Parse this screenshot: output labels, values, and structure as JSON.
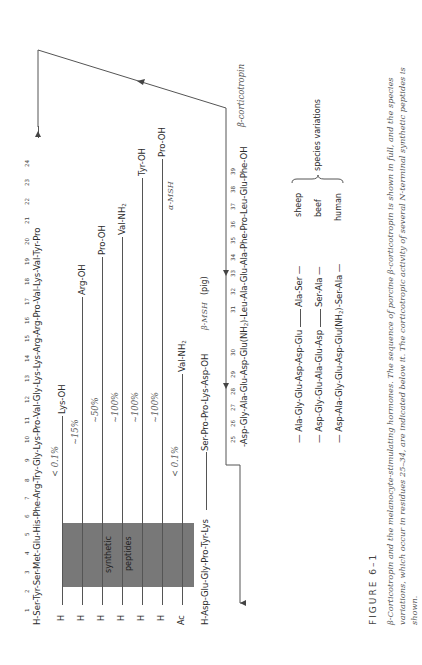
{
  "figure": {
    "label": "FIGURE 6–1",
    "caption_line1": "β-Corticotropin and the melanocyte-stimulating hormones.  The sequence of porcine β-corticotropin is shown in full, and the species",
    "caption_line2": "variations, which occur in residues 25–34, are indicated below it.  The corticotropic activity of several N-terminal synthetic peptides is",
    "caption_line3": "shown."
  },
  "main_sequence": {
    "prefix": "H-",
    "residues_1_24": [
      "Ser",
      "Tyr",
      "Ser",
      "Met",
      "Glu",
      "His",
      "Phe",
      "Arg",
      "Try",
      "Gly",
      "Lys",
      "Pro",
      "Val",
      "Gly",
      "Lys",
      "Lys",
      "Arg",
      "Arg",
      "Pro",
      "Val",
      "Lys",
      "Val",
      "Tyr",
      "Pro"
    ],
    "numbers_1_24": [
      "1",
      "2",
      "3",
      "4",
      "5",
      "6",
      "7",
      "8",
      "9",
      "10",
      "11",
      "12",
      "13",
      "14",
      "15",
      "16",
      "17",
      "18",
      "19",
      "20",
      "21",
      "22",
      "23",
      "24"
    ],
    "text_1_24": "H-Ser-Tyr-Ser-Met-Glu-His-Phe-Arg-Try-Gly-Lys-Pro-Val-Gly-Lys-Lys-Arg-Arg-Pro-Val-Lys-Val-Tyr-Pro",
    "residues_25_39": [
      "Asp",
      "Gly",
      "Ala",
      "Glu",
      "Asp",
      "Glu(NH2)",
      "Leu",
      "Ala",
      "Glu",
      "Ala",
      "Phe",
      "Pro",
      "Leu",
      "Glu",
      "Phe"
    ],
    "numbers_25_39": [
      "25",
      "26",
      "27",
      "28",
      "29",
      "30",
      "31",
      "32",
      "33",
      "34",
      "35",
      "36",
      "37",
      "38",
      "39"
    ],
    "text_25_30": "-Asp-Gly-Ala-Glu-Asp-Glu(NH",
    "text_30_sub": "2",
    "text_31_39": ")-Leu-Ala-Glu-Ala-Phe-Pro-Leu-Glu-Phe-OH",
    "label": "β-corticotropin"
  },
  "synthetic_peptides": {
    "box_label_1": "synthetic",
    "box_label_2": "peptides",
    "rows": [
      {
        "n_term": "H",
        "activity": "<0.1%",
        "c_term": "Lys-OH",
        "end_residue": 11
      },
      {
        "n_term": "H",
        "activity": "~15%",
        "c_term": "Arg-OH",
        "end_residue": 17
      },
      {
        "n_term": "H",
        "activity": "~50%",
        "c_term": "Pro-OH",
        "end_residue": 19
      },
      {
        "n_term": "H",
        "activity": "~100%",
        "c_term": "Val-NH2",
        "c_term_base": "Val-NH",
        "c_term_sub": "2",
        "end_residue": 20
      },
      {
        "n_term": "H",
        "activity": "~100%",
        "c_term": "Tyr-OH",
        "end_residue": 23
      },
      {
        "n_term": "H",
        "activity": "~100%",
        "c_term": "Pro-OH",
        "end_residue": 24
      },
      {
        "n_term": "Ac",
        "activity": "<0.1%",
        "c_term": "Val-NH2",
        "c_term_base": "Val-NH",
        "c_term_sub": "2",
        "end_residue": 13
      }
    ],
    "activity_display": [
      "< 0.1",
      "∼15",
      "∼50",
      "∼100",
      "∼100",
      "∼100",
      "< 0.1"
    ],
    "percent_sign": "%"
  },
  "msh": {
    "alpha_label": "α-MSH",
    "beta_prefix": "H-Asp-Glu-Gly-Pro-Tyr-Lys",
    "beta_suffix": "Ser-Pro-Pro-Lys-Asp-OH",
    "beta_label": "β-MSH",
    "beta_species": "(pig)"
  },
  "species_variations": {
    "label": "species variations",
    "rows": [
      {
        "species": "sheep",
        "seg1": "— Ala-Gly-Glu-Asp-Asp-Glu",
        "seg2": "Ala-Ser —"
      },
      {
        "species": "beef",
        "seg1": "— Asp-Gly-Glu-Ala-Glu-Asp",
        "seg2": "Ser-Ala —"
      },
      {
        "species": "human",
        "seg1": "— Asp-Ala-Gly-Glu-Asp-Glu(NH",
        "seg1_sub": "2",
        "seg1_tail": ")-Ser-Ala —",
        "seg2": ""
      }
    ]
  }
}
